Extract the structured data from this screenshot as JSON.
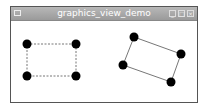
{
  "window": {
    "title": "graphics_view_demo",
    "controls": {
      "minimize": "_",
      "maximize": "□",
      "close": "×"
    }
  },
  "scene": {
    "left_shape": {
      "style": "dashed",
      "points": [
        [
          27,
          44
        ],
        [
          76,
          44
        ],
        [
          76,
          76
        ],
        [
          27,
          76
        ]
      ]
    },
    "right_shape": {
      "style": "solid",
      "points": [
        [
          134,
          37
        ],
        [
          181,
          54
        ],
        [
          171,
          82
        ],
        [
          123,
          65
        ]
      ]
    },
    "handle_color": "#000000",
    "line_color": "#777777"
  }
}
